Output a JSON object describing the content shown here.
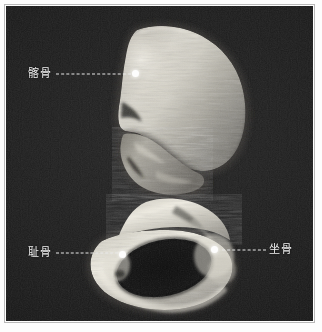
{
  "figure": {
    "kind": "ct-volume-rendering",
    "plate_background_color": "#1b1b1b",
    "annotation_color": "#f2f2f2",
    "frame_color": "#b9b9b9"
  },
  "annotations": [
    {
      "id": "ilium",
      "label": "髂骨",
      "label_side": "left",
      "label_x": 28,
      "label_y": 74,
      "line_x": 56,
      "line_y": 74,
      "line_length": 75,
      "dot_x": 135,
      "dot_y": 73
    },
    {
      "id": "pubis",
      "label": "耻骨",
      "label_side": "left",
      "label_x": 28,
      "label_y": 253,
      "line_x": 56,
      "line_y": 253,
      "line_length": 62,
      "dot_x": 122,
      "dot_y": 254
    },
    {
      "id": "ischium",
      "label": "坐骨",
      "label_side": "right",
      "label_x": 269,
      "label_y": 250,
      "line_x": 222,
      "line_y": 250,
      "line_length": 44,
      "dot_x": 214,
      "dot_y": 249
    }
  ]
}
